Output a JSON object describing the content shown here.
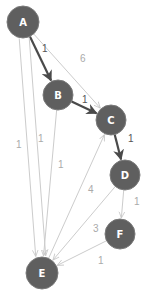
{
  "graph": {
    "colors": {
      "node_fill": "#5f5f5f",
      "node_stroke": "#7a7a7a",
      "node_text": "#ffffff",
      "edge_bold": "#4a4a4a",
      "edge_light": "#cccccc",
      "label_bold": "#555555",
      "label_light": "#aaaaaa"
    },
    "nodes": [
      {
        "id": "A",
        "label": "A",
        "x": 23,
        "y": 22,
        "r": 16
      },
      {
        "id": "B",
        "label": "B",
        "x": 58,
        "y": 95,
        "r": 15
      },
      {
        "id": "C",
        "label": "C",
        "x": 111,
        "y": 120,
        "r": 15
      },
      {
        "id": "D",
        "label": "D",
        "x": 125,
        "y": 175,
        "r": 15
      },
      {
        "id": "F",
        "label": "F",
        "x": 120,
        "y": 234,
        "r": 15
      },
      {
        "id": "E",
        "label": "E",
        "x": 42,
        "y": 273,
        "r": 16
      }
    ],
    "edges": [
      {
        "from": "A",
        "to": "B",
        "label": "1",
        "bold": true,
        "lx": 42,
        "ly": 52
      },
      {
        "from": "B",
        "to": "C",
        "label": "1",
        "bold": true,
        "lx": 82,
        "ly": 103
      },
      {
        "from": "C",
        "to": "D",
        "label": "1",
        "bold": true,
        "lx": 128,
        "ly": 142
      },
      {
        "from": "A",
        "to": "C",
        "label": "6",
        "bold": false,
        "lx": 80,
        "ly": 62
      },
      {
        "from": "A",
        "to": "E",
        "label": "1",
        "bold": false,
        "lx": 16,
        "ly": 148,
        "offset": -5
      },
      {
        "from": "A",
        "to": "E",
        "label": "1",
        "bold": false,
        "lx": 38,
        "ly": 142,
        "offset": 5
      },
      {
        "from": "B",
        "to": "E",
        "label": "1",
        "bold": false,
        "lx": 58,
        "ly": 168
      },
      {
        "from": "E",
        "to": "C",
        "label": "4",
        "bold": false,
        "lx": 88,
        "ly": 193
      },
      {
        "from": "D",
        "to": "E",
        "label": "3",
        "bold": false,
        "lx": 93,
        "ly": 232
      },
      {
        "from": "D",
        "to": "F",
        "label": "1",
        "bold": false,
        "lx": 134,
        "ly": 205
      },
      {
        "from": "F",
        "to": "E",
        "label": "1",
        "bold": false,
        "lx": 98,
        "ly": 264
      }
    ]
  }
}
